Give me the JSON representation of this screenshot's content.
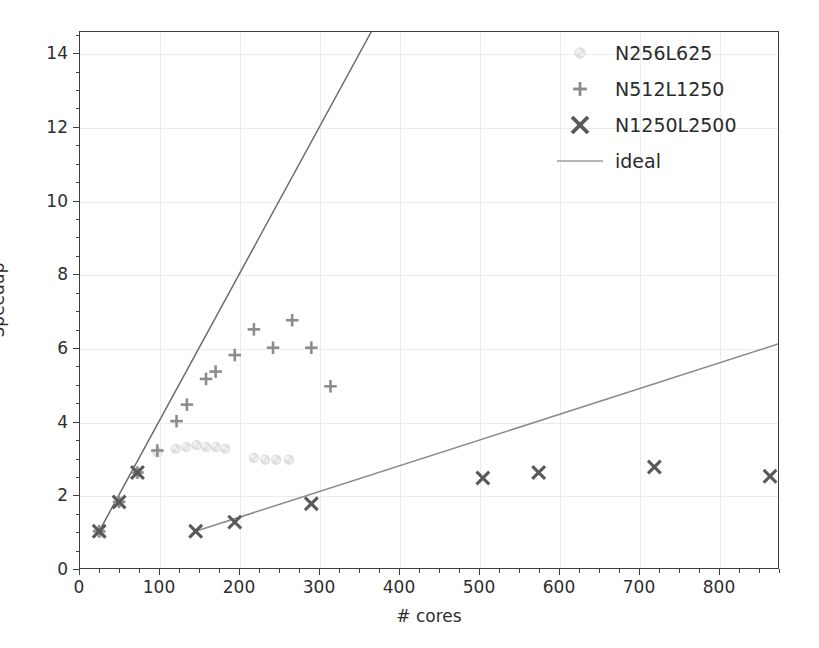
{
  "page": {
    "caption_sliver": "                                                                          "
  },
  "chart_data": {
    "type": "scatter",
    "title": "",
    "xlabel": "# cores",
    "ylabel": "Speedup",
    "xlim": [
      0,
      875
    ],
    "ylim": [
      0,
      14.6
    ],
    "xticks": [
      0,
      100,
      200,
      300,
      400,
      500,
      600,
      700,
      800
    ],
    "yticks": [
      0,
      2,
      4,
      6,
      8,
      10,
      12,
      14
    ],
    "xtick_labels": [
      "0",
      "100",
      "200",
      "300",
      "400",
      "500",
      "600",
      "700",
      "800"
    ],
    "ytick_labels": [
      "0",
      "2",
      "4",
      "6",
      "8",
      "10",
      "12",
      "14"
    ],
    "x_minor_step": 25,
    "y_minor_step": 0.5,
    "grid": true,
    "legend_position": "upper right",
    "colors": {
      "n256": "#d9d9d9",
      "n512": "#8c8c8c",
      "n1250": "#595959",
      "ideal": "#6b6b6b",
      "axis": "#3f3f3f",
      "grid": "#ececec",
      "text": "#2e2e2e"
    },
    "series": [
      {
        "name": "N256L625",
        "marker": "dot",
        "color": "#d9d9d9",
        "points": [
          [
            24,
            1.0
          ],
          [
            26,
            0.95
          ],
          [
            49,
            1.8
          ],
          [
            72,
            2.6
          ],
          [
            97,
            3.15
          ],
          [
            120,
            3.25
          ],
          [
            133,
            3.3
          ],
          [
            146,
            3.35
          ],
          [
            158,
            3.3
          ],
          [
            170,
            3.3
          ],
          [
            182,
            3.25
          ],
          [
            218,
            3.0
          ],
          [
            232,
            2.95
          ],
          [
            246,
            2.95
          ],
          [
            262,
            2.95
          ]
        ]
      },
      {
        "name": "N512L1250",
        "marker": "plus",
        "color": "#8c8c8c",
        "points": [
          [
            24,
            1.0
          ],
          [
            49,
            1.8
          ],
          [
            72,
            2.6
          ],
          [
            97,
            3.2
          ],
          [
            121,
            4.0
          ],
          [
            134,
            4.45
          ],
          [
            158,
            5.15
          ],
          [
            170,
            5.35
          ],
          [
            194,
            5.8
          ],
          [
            218,
            6.5
          ],
          [
            242,
            6.0
          ],
          [
            266,
            6.75
          ],
          [
            290,
            6.0
          ],
          [
            314,
            4.95
          ]
        ]
      },
      {
        "name": "N1250L2500",
        "marker": "cross",
        "color": "#595959",
        "points": [
          [
            24,
            1.0
          ],
          [
            49,
            1.8
          ],
          [
            72,
            2.6
          ],
          [
            145,
            1.0
          ],
          [
            194,
            1.25
          ],
          [
            290,
            1.75
          ],
          [
            505,
            2.45
          ],
          [
            575,
            2.6
          ],
          [
            720,
            2.75
          ],
          [
            865,
            2.5
          ]
        ]
      }
    ],
    "ideal_lines": [
      {
        "name": "ideal",
        "color": "#6b6b6b",
        "slope": 0.0403,
        "from": [
          24,
          1.0
        ],
        "to": [
          365,
          14.6
        ],
        "description": "steep ideal scaling line"
      },
      {
        "name": "ideal",
        "color": "#8a8a8a",
        "slope": 0.00606,
        "from": [
          145,
          1.0
        ],
        "to": [
          875,
          6.1
        ],
        "description": "shallow ideal scaling line"
      }
    ],
    "legend": [
      {
        "label": "N256L625",
        "marker": "dot"
      },
      {
        "label": "N512L1250",
        "marker": "plus"
      },
      {
        "label": "N1250L2500",
        "marker": "cross"
      },
      {
        "label": "ideal",
        "marker": "line"
      }
    ]
  }
}
